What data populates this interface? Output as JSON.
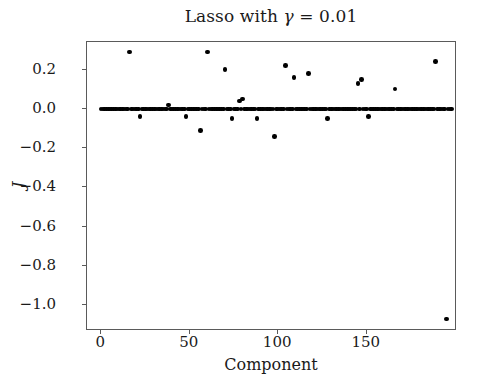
{
  "chart_data": {
    "type": "scatter",
    "title": "Lasso with γ = 0.01",
    "title_prefix": "Lasso with ",
    "title_gamma": "γ",
    "title_suffix": " = 0.01",
    "xlabel": "Component",
    "ylabel": "J",
    "xlim": [
      -8,
      201
    ],
    "ylim": [
      -1.13,
      0.34
    ],
    "grid": false,
    "legend": null,
    "marker": "circle",
    "marker_color": "#000000",
    "xticks": [
      0,
      50,
      100,
      150
    ],
    "xtick_labels": [
      "0",
      "50",
      "100",
      "150"
    ],
    "yticks": [
      0.2,
      0.0,
      -0.2,
      -0.4,
      -0.6,
      -0.8,
      -1.0
    ],
    "ytick_labels": [
      "0.2",
      "0.0",
      "−0.2",
      "−0.4",
      "−0.6",
      "−0.8",
      "−1.0"
    ],
    "points": [
      [
        0,
        0.0
      ],
      [
        1,
        0.0
      ],
      [
        2,
        0.0
      ],
      [
        3,
        0.0
      ],
      [
        4,
        0.0
      ],
      [
        5,
        0.0
      ],
      [
        6,
        0.0
      ],
      [
        7,
        0.0
      ],
      [
        8,
        0.0
      ],
      [
        9,
        0.0
      ],
      [
        10,
        0.0
      ],
      [
        11,
        0.0
      ],
      [
        12,
        0.0
      ],
      [
        13,
        0.0
      ],
      [
        14,
        0.0
      ],
      [
        15,
        0.0
      ],
      [
        16,
        0.29
      ],
      [
        17,
        0.0
      ],
      [
        18,
        0.0
      ],
      [
        19,
        0.0
      ],
      [
        20,
        0.0
      ],
      [
        21,
        0.0
      ],
      [
        22,
        -0.04
      ],
      [
        23,
        0.0
      ],
      [
        24,
        0.0
      ],
      [
        25,
        0.0
      ],
      [
        26,
        0.0
      ],
      [
        27,
        0.0
      ],
      [
        28,
        0.0
      ],
      [
        29,
        0.0
      ],
      [
        30,
        0.0
      ],
      [
        31,
        0.0
      ],
      [
        32,
        0.0
      ],
      [
        33,
        0.0
      ],
      [
        34,
        0.0
      ],
      [
        35,
        0.0
      ],
      [
        36,
        0.0
      ],
      [
        37,
        0.0
      ],
      [
        38,
        0.02
      ],
      [
        39,
        0.0
      ],
      [
        40,
        0.0
      ],
      [
        41,
        0.0
      ],
      [
        42,
        0.0
      ],
      [
        43,
        0.0
      ],
      [
        44,
        0.0
      ],
      [
        45,
        0.0
      ],
      [
        46,
        0.0
      ],
      [
        47,
        0.0
      ],
      [
        48,
        -0.04
      ],
      [
        49,
        0.0
      ],
      [
        50,
        0.0
      ],
      [
        51,
        0.0
      ],
      [
        52,
        0.0
      ],
      [
        53,
        0.0
      ],
      [
        54,
        0.0
      ],
      [
        55,
        0.0
      ],
      [
        56,
        -0.11
      ],
      [
        57,
        0.0
      ],
      [
        58,
        0.0
      ],
      [
        59,
        0.0
      ],
      [
        60,
        0.29
      ],
      [
        61,
        0.0
      ],
      [
        62,
        0.0
      ],
      [
        63,
        0.0
      ],
      [
        64,
        0.0
      ],
      [
        65,
        0.0
      ],
      [
        66,
        0.0
      ],
      [
        67,
        0.0
      ],
      [
        68,
        0.0
      ],
      [
        69,
        0.0
      ],
      [
        70,
        0.2
      ],
      [
        71,
        0.0
      ],
      [
        72,
        0.0
      ],
      [
        73,
        0.0
      ],
      [
        74,
        -0.05
      ],
      [
        75,
        0.0
      ],
      [
        76,
        0.0
      ],
      [
        77,
        0.0
      ],
      [
        78,
        0.04
      ],
      [
        79,
        0.0
      ],
      [
        80,
        0.05
      ],
      [
        81,
        0.0
      ],
      [
        82,
        0.0
      ],
      [
        83,
        0.0
      ],
      [
        84,
        0.0
      ],
      [
        85,
        0.0
      ],
      [
        86,
        0.0
      ],
      [
        87,
        0.0
      ],
      [
        88,
        -0.05
      ],
      [
        89,
        0.0
      ],
      [
        90,
        0.0
      ],
      [
        91,
        0.0
      ],
      [
        92,
        0.0
      ],
      [
        93,
        0.0
      ],
      [
        94,
        0.0
      ],
      [
        95,
        0.0
      ],
      [
        96,
        0.0
      ],
      [
        97,
        0.0
      ],
      [
        98,
        -0.14
      ],
      [
        99,
        0.0
      ],
      [
        100,
        0.0
      ],
      [
        101,
        0.0
      ],
      [
        102,
        0.0
      ],
      [
        103,
        0.0
      ],
      [
        104,
        0.22
      ],
      [
        105,
        0.0
      ],
      [
        106,
        0.0
      ],
      [
        107,
        0.0
      ],
      [
        108,
        0.0
      ],
      [
        109,
        0.16
      ],
      [
        110,
        0.0
      ],
      [
        111,
        0.0
      ],
      [
        112,
        0.0
      ],
      [
        113,
        0.0
      ],
      [
        114,
        0.0
      ],
      [
        115,
        0.0
      ],
      [
        116,
        0.0
      ],
      [
        117,
        0.18
      ],
      [
        118,
        0.0
      ],
      [
        119,
        0.0
      ],
      [
        120,
        0.0
      ],
      [
        121,
        0.0
      ],
      [
        122,
        0.0
      ],
      [
        123,
        0.0
      ],
      [
        124,
        0.0
      ],
      [
        125,
        0.0
      ],
      [
        126,
        0.0
      ],
      [
        127,
        0.0
      ],
      [
        128,
        -0.05
      ],
      [
        129,
        0.0
      ],
      [
        130,
        0.0
      ],
      [
        131,
        0.0
      ],
      [
        132,
        0.0
      ],
      [
        133,
        0.0
      ],
      [
        134,
        0.0
      ],
      [
        135,
        0.0
      ],
      [
        136,
        0.0
      ],
      [
        137,
        0.0
      ],
      [
        138,
        0.0
      ],
      [
        139,
        0.0
      ],
      [
        140,
        0.0
      ],
      [
        141,
        0.0
      ],
      [
        142,
        0.0
      ],
      [
        143,
        0.0
      ],
      [
        144,
        0.0
      ],
      [
        145,
        0.13
      ],
      [
        146,
        0.0
      ],
      [
        147,
        0.15
      ],
      [
        148,
        0.0
      ],
      [
        149,
        0.0
      ],
      [
        150,
        0.0
      ],
      [
        151,
        -0.04
      ],
      [
        152,
        0.0
      ],
      [
        153,
        0.0
      ],
      [
        154,
        0.0
      ],
      [
        155,
        0.0
      ],
      [
        156,
        0.0
      ],
      [
        157,
        0.0
      ],
      [
        158,
        0.0
      ],
      [
        159,
        0.0
      ],
      [
        160,
        0.0
      ],
      [
        161,
        0.0
      ],
      [
        162,
        0.0
      ],
      [
        163,
        0.0
      ],
      [
        164,
        0.0
      ],
      [
        165,
        0.0
      ],
      [
        166,
        0.1
      ],
      [
        167,
        0.0
      ],
      [
        168,
        0.0
      ],
      [
        169,
        0.0
      ],
      [
        170,
        0.0
      ],
      [
        171,
        0.0
      ],
      [
        172,
        0.0
      ],
      [
        173,
        0.0
      ],
      [
        174,
        0.0
      ],
      [
        175,
        0.0
      ],
      [
        176,
        0.0
      ],
      [
        177,
        0.0
      ],
      [
        178,
        0.0
      ],
      [
        179,
        0.0
      ],
      [
        180,
        0.0
      ],
      [
        181,
        0.0
      ],
      [
        182,
        0.0
      ],
      [
        183,
        0.0
      ],
      [
        184,
        0.0
      ],
      [
        185,
        0.0
      ],
      [
        186,
        0.0
      ],
      [
        187,
        0.0
      ],
      [
        188,
        0.0
      ],
      [
        189,
        0.24
      ],
      [
        190,
        0.0
      ],
      [
        191,
        0.0
      ],
      [
        192,
        0.0
      ],
      [
        193,
        0.0
      ],
      [
        194,
        0.0
      ],
      [
        195,
        -1.07
      ],
      [
        196,
        0.0
      ],
      [
        197,
        0.0
      ],
      [
        198,
        0.0
      ]
    ]
  }
}
